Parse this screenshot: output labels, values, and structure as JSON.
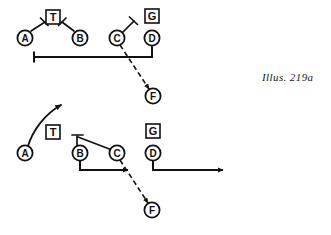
{
  "figure": {
    "caption": "Illus. 219a",
    "type": "football-play-diagram",
    "panels": [
      {
        "name": "top-formation",
        "players": [
          {
            "label": "A",
            "shape": "circle",
            "x": 25,
            "y": 38
          },
          {
            "label": "B",
            "shape": "circle",
            "x": 80,
            "y": 38
          },
          {
            "label": "C",
            "shape": "circle",
            "x": 117,
            "y": 38
          },
          {
            "label": "D",
            "shape": "circle",
            "x": 152,
            "y": 38
          },
          {
            "label": "F",
            "shape": "circle",
            "x": 153,
            "y": 96
          },
          {
            "label": "T",
            "shape": "square",
            "x": 53,
            "y": 17
          },
          {
            "label": "G",
            "shape": "square",
            "x": 152,
            "y": 16
          }
        ],
        "routes": [
          {
            "kind": "block",
            "from": "A",
            "to_x": 44,
            "to_y": 22
          },
          {
            "kind": "block",
            "from": "B",
            "to_x": 63,
            "to_y": 21
          },
          {
            "kind": "block",
            "from": "C",
            "to_x": 134,
            "to_y": 20
          },
          {
            "kind": "motion",
            "from": "D",
            "via": "down-then-left",
            "end_x": 34,
            "end_y": 57
          },
          {
            "kind": "handoff",
            "from": "C",
            "to": "F",
            "style": "dashed",
            "arrow": true
          }
        ]
      },
      {
        "name": "bottom-formation",
        "players": [
          {
            "label": "A",
            "shape": "circle",
            "x": 25,
            "y": 153
          },
          {
            "label": "B",
            "shape": "circle",
            "x": 80,
            "y": 153
          },
          {
            "label": "C",
            "shape": "circle",
            "x": 117,
            "y": 153
          },
          {
            "label": "D",
            "shape": "circle",
            "x": 153,
            "y": 153
          },
          {
            "label": "F",
            "shape": "circle",
            "x": 152,
            "y": 210
          },
          {
            "label": "T",
            "shape": "square",
            "x": 53,
            "y": 132
          },
          {
            "label": "G",
            "shape": "square",
            "x": 153,
            "y": 131
          }
        ],
        "routes": [
          {
            "kind": "run",
            "from": "A",
            "style": "curved-arrow",
            "end_x": 62,
            "end_y": 103
          },
          {
            "kind": "block",
            "from": "B",
            "to_x": 77,
            "to_y": 134
          },
          {
            "kind": "link",
            "from": "B",
            "to": "C"
          },
          {
            "kind": "run",
            "from": "B",
            "via": "down-then-right",
            "end_x": 130,
            "end_y": 170
          },
          {
            "kind": "run",
            "from": "D",
            "via": "down-then-right",
            "end_x": 225,
            "end_y": 170
          },
          {
            "kind": "handoff",
            "from": "C",
            "to": "F",
            "style": "dashed",
            "arrow": true
          }
        ]
      }
    ]
  },
  "style": {
    "ink": "#111111",
    "paper": "#ffffff",
    "stroke_width": 1.6
  }
}
